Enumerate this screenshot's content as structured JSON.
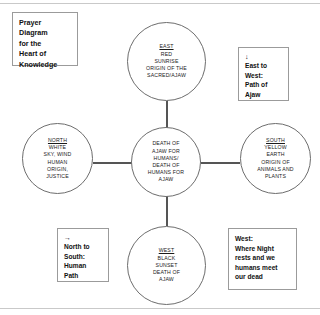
{
  "title_box": {
    "text": "Prayer\nDiagram\nfor the\nHeart of\nKnowledge"
  },
  "diagram": {
    "nodes": {
      "east": {
        "heading": "EAST",
        "lines": "RED\nSUNRISE\nORIGIN OF THE\nSACRED/AJAW"
      },
      "north": {
        "heading": "NORTH",
        "lines": "WHITE\nSKY, WIND\nHUMAN\nORIGIN,\nJUSTICE"
      },
      "center": {
        "heading": "",
        "lines": "DEATH OF\nAJAW FOR\nHUMANS/\nDEATH OF\nHUMANS FOR\nAJAW"
      },
      "south": {
        "heading": "SOUTH",
        "lines": "YELLOW\nEARTH\nORIGIN OF\nANIMALS AND\nPLANTS"
      },
      "west": {
        "heading": "WEST",
        "lines": "BLACK\nSUNSET\nDEATH OF\nAJAW"
      }
    }
  },
  "annotations": {
    "east_to_west": {
      "arrow": "↓",
      "text": "East to\nWest:\nPath of\nAjaw"
    },
    "north_to_south": {
      "arrow": "→",
      "text": "North to\nSouth:\nHuman\nPath"
    },
    "west_note": {
      "text": "West:\nWhere Night\nrests and we\nhumans meet\nour dead"
    }
  },
  "colors": {
    "stroke": "#6d6d6d",
    "connector": "#555555",
    "box_border": "#9b9b9b",
    "text": "#1a1a1a",
    "background": "#ffffff"
  }
}
